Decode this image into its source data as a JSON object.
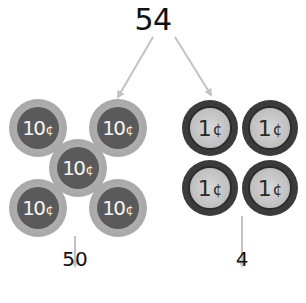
{
  "diagram": {
    "total": "54",
    "tens": {
      "label": "50",
      "coin_value": "10",
      "coin_unit": "¢",
      "count": 5
    },
    "ones": {
      "label": "4",
      "coin_value": "1",
      "coin_unit": "¢",
      "count": 4
    }
  },
  "colors": {
    "arrow": "#bdbdbd",
    "dime_rim": "#b0b0b0",
    "dime_face": "#5a5a5a",
    "penny_rim": "#3b3b3b",
    "penny_face": "#c4c4c4",
    "text": "#111111"
  }
}
